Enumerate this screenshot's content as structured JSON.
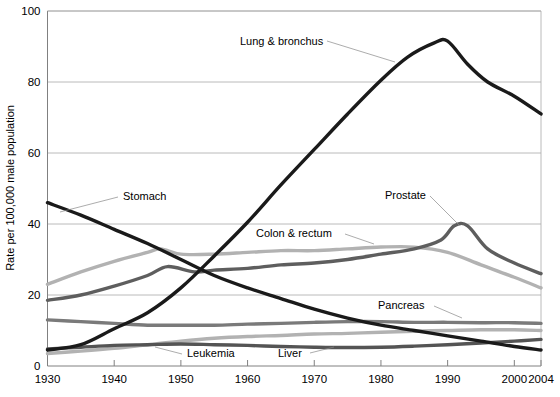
{
  "chart_data": {
    "type": "line",
    "title": "",
    "xlabel": "",
    "ylabel": "Rate per 100,000 male population",
    "xlim": [
      1930,
      2004
    ],
    "ylim": [
      0,
      100
    ],
    "grid": true,
    "legend_position": "inline-annotations",
    "xticks": [
      "1930",
      "1940",
      "1950",
      "1960",
      "1970",
      "1980",
      "1990",
      "2000",
      "2004"
    ],
    "xtick_values": [
      1930,
      1940,
      1950,
      1960,
      1970,
      1980,
      1990,
      2000,
      2004
    ],
    "yticks": [
      "0",
      "20",
      "40",
      "60",
      "80",
      "100"
    ],
    "ytick_values": [
      0,
      20,
      40,
      60,
      80,
      100
    ],
    "x": [
      1930,
      1935,
      1940,
      1945,
      1950,
      1955,
      1960,
      1965,
      1970,
      1975,
      1980,
      1985,
      1990,
      1995,
      2000,
      2004
    ],
    "series": [
      {
        "name": "Lung & bronchus",
        "color": "#1a1a1a",
        "x": [
          1930,
          1935,
          1940,
          1945,
          1950,
          1955,
          1960,
          1965,
          1970,
          1975,
          1980,
          1984,
          1988,
          1990,
          1993,
          1996,
          2000,
          2004
        ],
        "values": [
          4.5,
          6.0,
          10.5,
          15.0,
          22.0,
          31.0,
          40.5,
          51.0,
          61.0,
          71.0,
          80.5,
          87.0,
          91.0,
          91.5,
          85.0,
          80.0,
          76.0,
          71.0
        ]
      },
      {
        "name": "Stomach",
        "color": "#1a1a1a",
        "x": [
          1930,
          1935,
          1940,
          1945,
          1950,
          1955,
          1960,
          1965,
          1970,
          1975,
          1980,
          1985,
          1990,
          1995,
          2000,
          2004
        ],
        "values": [
          46.0,
          42.5,
          38.5,
          34.5,
          30.0,
          25.5,
          22.0,
          19.0,
          16.0,
          13.5,
          11.5,
          10.0,
          8.5,
          7.0,
          5.5,
          4.5
        ]
      },
      {
        "name": "Colon & rectum",
        "color": "#b2b2b2",
        "x": [
          1930,
          1935,
          1940,
          1945,
          1947,
          1950,
          1955,
          1960,
          1965,
          1970,
          1975,
          1980,
          1985,
          1990,
          1995,
          2000,
          2004
        ],
        "values": [
          23.0,
          26.5,
          29.5,
          32.0,
          33.0,
          31.5,
          31.5,
          32.0,
          32.5,
          32.5,
          33.0,
          33.5,
          33.5,
          32.0,
          28.5,
          25.0,
          22.0
        ]
      },
      {
        "name": "Prostate",
        "color": "#5e5e5e",
        "x": [
          1930,
          1935,
          1940,
          1945,
          1948,
          1952,
          1955,
          1960,
          1965,
          1970,
          1975,
          1980,
          1985,
          1989,
          1991,
          1993,
          1996,
          2000,
          2004
        ],
        "values": [
          18.5,
          20.0,
          22.5,
          25.5,
          28.0,
          26.5,
          27.0,
          27.5,
          28.5,
          29.0,
          30.0,
          31.5,
          33.0,
          35.5,
          39.5,
          39.5,
          33.0,
          29.0,
          26.0
        ]
      },
      {
        "name": "Pancreas",
        "color": "#7a7a7a",
        "x": [
          1930,
          1935,
          1940,
          1945,
          1950,
          1955,
          1960,
          1965,
          1970,
          1975,
          1980,
          1985,
          1990,
          1995,
          2000,
          2004
        ],
        "values": [
          13.0,
          12.5,
          12.0,
          11.5,
          11.5,
          11.5,
          11.8,
          12.0,
          12.3,
          12.5,
          12.5,
          12.3,
          12.3,
          12.2,
          12.2,
          12.0
        ]
      },
      {
        "name": "Leukemia",
        "color": "#b2b2b2",
        "x": [
          1930,
          1935,
          1940,
          1945,
          1950,
          1955,
          1960,
          1965,
          1970,
          1975,
          1980,
          1985,
          1990,
          1995,
          2000,
          2004
        ],
        "values": [
          3.5,
          4.2,
          5.0,
          6.0,
          7.0,
          7.8,
          8.3,
          8.6,
          9.0,
          9.2,
          9.5,
          9.8,
          10.0,
          10.2,
          10.2,
          10.0
        ]
      },
      {
        "name": "Liver",
        "color": "#545454",
        "x": [
          1930,
          1935,
          1940,
          1945,
          1950,
          1955,
          1960,
          1965,
          1970,
          1975,
          1980,
          1985,
          1990,
          1995,
          2000,
          2004
        ],
        "values": [
          4.8,
          5.3,
          5.8,
          6.0,
          6.2,
          6.0,
          5.8,
          5.5,
          5.3,
          5.2,
          5.3,
          5.6,
          6.0,
          6.5,
          7.0,
          7.5
        ]
      }
    ],
    "annotations": [
      {
        "label": "Lung & bronchus",
        "x": 240,
        "y": 45
      },
      {
        "label": "Stomach",
        "x": 123,
        "y": 200
      },
      {
        "label": "Colon & rectum",
        "x": 256,
        "y": 237
      },
      {
        "label": "Prostate",
        "x": 385,
        "y": 199
      },
      {
        "label": "Pancreas",
        "x": 378,
        "y": 309
      },
      {
        "label": "Leukemia",
        "x": 187,
        "y": 357
      },
      {
        "label": "Liver",
        "x": 278,
        "y": 357
      }
    ]
  }
}
